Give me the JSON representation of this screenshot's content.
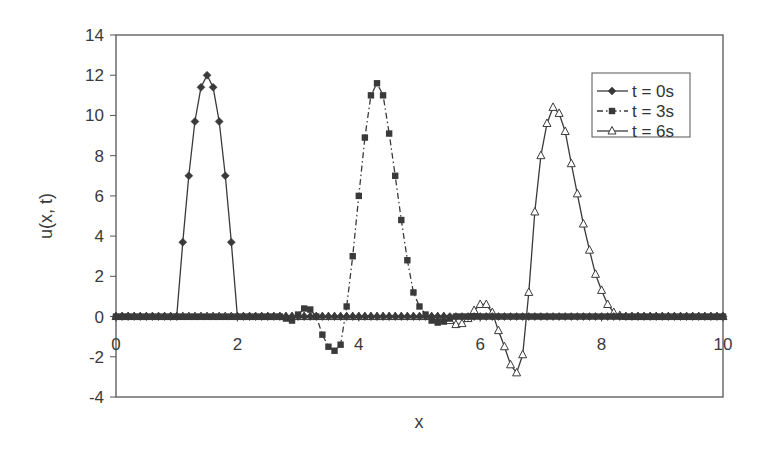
{
  "chart_data": {
    "type": "line",
    "title": "",
    "xlabel": "x",
    "ylabel": "u(x, t)",
    "xlim": [
      0,
      10
    ],
    "ylim": [
      -4,
      14
    ],
    "xticks": [
      0,
      2,
      4,
      6,
      8,
      10
    ],
    "yticks": [
      -4,
      -2,
      0,
      2,
      4,
      6,
      8,
      10,
      12,
      14
    ],
    "grid": false,
    "legend_position": "upper right inside",
    "series": [
      {
        "name": "t = 0s",
        "marker": "diamond",
        "line": "solid",
        "x": [
          0.0,
          0.1,
          0.2,
          0.3,
          0.4,
          0.5,
          0.6,
          0.7,
          0.8,
          0.9,
          1.0,
          1.1,
          1.2,
          1.3,
          1.4,
          1.5,
          1.6,
          1.7,
          1.8,
          1.9,
          2.0,
          2.1,
          2.2,
          2.3,
          2.4,
          2.5,
          2.6,
          2.7,
          2.8,
          2.9,
          3.0,
          3.1,
          3.2,
          3.3,
          3.4,
          3.5,
          3.6,
          3.7,
          3.8,
          3.9,
          4.0,
          4.1,
          4.2,
          4.3,
          4.4,
          4.5,
          4.6,
          4.7,
          4.8,
          4.9,
          5.0,
          5.1,
          5.2,
          5.3,
          5.4,
          5.5,
          5.6,
          5.7,
          5.8,
          5.9,
          6.0,
          6.1,
          6.2,
          6.3,
          6.4,
          6.5,
          6.6,
          6.7,
          6.8,
          6.9,
          7.0,
          7.1,
          7.2,
          7.3,
          7.4,
          7.5,
          7.6,
          7.7,
          7.8,
          7.9,
          8.0,
          8.1,
          8.2,
          8.3,
          8.4,
          8.5,
          8.6,
          8.7,
          8.8,
          8.9,
          9.0,
          9.1,
          9.2,
          9.3,
          9.4,
          9.5,
          9.6,
          9.7,
          9.8,
          9.9,
          10.0
        ],
        "values": [
          0,
          0,
          0,
          0,
          0,
          0,
          0,
          0,
          0,
          0,
          0,
          3.7,
          7.0,
          9.7,
          11.4,
          12.0,
          11.4,
          9.7,
          7.0,
          3.7,
          0,
          0,
          0,
          0,
          0,
          0,
          0,
          0,
          0,
          0,
          0,
          0,
          0,
          0,
          0,
          0,
          0,
          0,
          0,
          0,
          0,
          0,
          0,
          0,
          0,
          0,
          0,
          0,
          0,
          0,
          0,
          0,
          0,
          0,
          0,
          0,
          0,
          0,
          0,
          0,
          0,
          0,
          0,
          0,
          0,
          0,
          0,
          0,
          0,
          0,
          0,
          0,
          0,
          0,
          0,
          0,
          0,
          0,
          0,
          0,
          0,
          0,
          0,
          0,
          0,
          0,
          0,
          0,
          0,
          0,
          0,
          0,
          0,
          0,
          0,
          0,
          0,
          0,
          0,
          0,
          0
        ]
      },
      {
        "name": "t = 3s",
        "marker": "square",
        "line": "dash-dot",
        "x": [
          0.0,
          0.1,
          0.2,
          0.3,
          0.4,
          0.5,
          0.6,
          0.7,
          0.8,
          0.9,
          1.0,
          1.1,
          1.2,
          1.3,
          1.4,
          1.5,
          1.6,
          1.7,
          1.8,
          1.9,
          2.0,
          2.1,
          2.2,
          2.3,
          2.4,
          2.5,
          2.6,
          2.7,
          2.8,
          2.9,
          3.0,
          3.1,
          3.2,
          3.3,
          3.4,
          3.5,
          3.6,
          3.7,
          3.8,
          3.9,
          4.0,
          4.1,
          4.2,
          4.3,
          4.4,
          4.5,
          4.6,
          4.7,
          4.8,
          4.9,
          5.0,
          5.1,
          5.2,
          5.3,
          5.4,
          5.5,
          5.6,
          5.7,
          5.8,
          5.9,
          6.0,
          6.1,
          6.2,
          6.3,
          6.4,
          6.5,
          6.6,
          6.7,
          6.8,
          6.9,
          7.0,
          7.1,
          7.2,
          7.3,
          7.4,
          7.5,
          7.6,
          7.7,
          7.8,
          7.9,
          8.0,
          8.1,
          8.2,
          8.3,
          8.4,
          8.5,
          8.6,
          8.7,
          8.8,
          8.9,
          9.0,
          9.1,
          9.2,
          9.3,
          9.4,
          9.5,
          9.6,
          9.7,
          9.8,
          9.9,
          10.0
        ],
        "values": [
          0,
          0,
          0,
          0,
          0,
          0,
          0,
          0,
          0,
          0,
          0,
          0,
          0,
          0,
          0,
          0,
          0,
          0,
          0,
          0,
          0,
          0,
          0,
          0,
          0,
          0,
          0,
          0,
          -0.1,
          -0.2,
          0.1,
          0.4,
          0.35,
          0,
          -0.9,
          -1.5,
          -1.7,
          -1.4,
          0.5,
          3.0,
          6.0,
          8.9,
          11.0,
          11.6,
          11.0,
          9.1,
          7.0,
          4.8,
          2.8,
          1.2,
          0.5,
          0.1,
          -0.2,
          -0.3,
          -0.25,
          -0.1,
          0,
          0,
          0,
          0,
          0,
          0,
          0,
          0,
          0,
          0,
          0,
          0,
          0,
          0,
          0,
          0,
          0,
          0,
          0,
          0,
          0,
          0,
          0,
          0,
          0,
          0,
          0,
          0,
          0,
          0,
          0,
          0,
          0,
          0,
          0,
          0,
          0,
          0,
          0,
          0,
          0,
          0,
          0,
          0,
          0
        ]
      },
      {
        "name": "t = 6s",
        "marker": "triangle",
        "line": "solid",
        "x": [
          0.0,
          0.1,
          0.2,
          0.3,
          0.4,
          0.5,
          0.6,
          0.7,
          0.8,
          0.9,
          1.0,
          1.1,
          1.2,
          1.3,
          1.4,
          1.5,
          1.6,
          1.7,
          1.8,
          1.9,
          2.0,
          2.1,
          2.2,
          2.3,
          2.4,
          2.5,
          2.6,
          2.7,
          2.8,
          2.9,
          3.0,
          3.1,
          3.2,
          3.3,
          3.4,
          3.5,
          3.6,
          3.7,
          3.8,
          3.9,
          4.0,
          4.1,
          4.2,
          4.3,
          4.4,
          4.5,
          4.6,
          4.7,
          4.8,
          4.9,
          5.0,
          5.1,
          5.2,
          5.3,
          5.4,
          5.5,
          5.6,
          5.7,
          5.8,
          5.9,
          6.0,
          6.1,
          6.2,
          6.3,
          6.4,
          6.5,
          6.6,
          6.7,
          6.8,
          6.9,
          7.0,
          7.1,
          7.2,
          7.3,
          7.4,
          7.5,
          7.6,
          7.7,
          7.8,
          7.9,
          8.0,
          8.1,
          8.2,
          8.3,
          8.4,
          8.5,
          8.6,
          8.7,
          8.8,
          8.9,
          9.0,
          9.1,
          9.2,
          9.3,
          9.4,
          9.5,
          9.6,
          9.7,
          9.8,
          9.9,
          10.0
        ],
        "values": [
          0,
          0,
          0,
          0,
          0,
          0,
          0,
          0,
          0,
          0,
          0,
          0,
          0,
          0,
          0,
          0,
          0,
          0,
          0,
          0,
          0,
          0,
          0,
          0,
          0,
          0,
          0,
          0,
          0,
          0,
          0,
          0,
          0,
          0,
          0,
          0,
          0,
          0,
          0,
          0,
          0,
          0,
          0,
          0,
          0,
          0,
          0,
          0,
          0,
          0,
          0,
          0,
          0,
          0,
          0,
          -0.2,
          -0.4,
          -0.35,
          -0.1,
          0.3,
          0.6,
          0.6,
          0.2,
          -0.7,
          -1.5,
          -2.4,
          -2.8,
          -1.9,
          1.2,
          5.2,
          8.0,
          9.6,
          10.4,
          10.1,
          9.2,
          7.6,
          6.1,
          4.6,
          3.3,
          2.1,
          1.3,
          0.6,
          0.2,
          0.05,
          0,
          0,
          0,
          0,
          0,
          0,
          0,
          0,
          0,
          0,
          0,
          0,
          0,
          0,
          0,
          0,
          0
        ]
      }
    ]
  },
  "legend": {
    "items": [
      {
        "label": "t = 0s"
      },
      {
        "label": "t = 3s"
      },
      {
        "label": "t = 6s"
      }
    ]
  },
  "axes": {
    "x_title": "x",
    "y_title": "u(x, t)",
    "x_tick_labels": [
      "0",
      "2",
      "4",
      "6",
      "8",
      "10"
    ],
    "y_tick_labels": [
      "-4",
      "-2",
      "0",
      "2",
      "4",
      "6",
      "8",
      "10",
      "12",
      "14"
    ]
  },
  "colors": {
    "line": "#3a3a3a",
    "frame": "#555555",
    "background": "#ffffff"
  }
}
